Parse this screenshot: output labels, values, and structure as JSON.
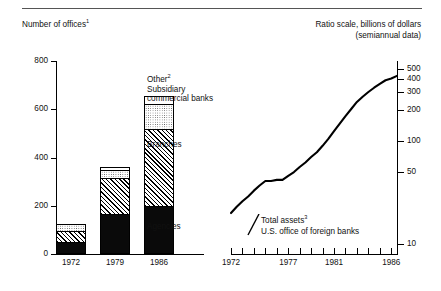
{
  "header": {
    "left_title": "Number of offices",
    "left_title_sup": "1",
    "right_title_line1": "Ratio scale, billions of dollars",
    "right_title_line2": "(semiannual data)"
  },
  "legend": {
    "other": "Other",
    "other_sup": "2",
    "subsidiary_line1": "Subsidiary",
    "subsidiary_line2": "commercial banks",
    "branches": "Branches",
    "agencies": "Agencies"
  },
  "annotation": {
    "line1": "Total assets",
    "line1_sup": "3",
    "line2": "U.S. office of foreign banks"
  },
  "chart_data": [
    {
      "type": "bar",
      "title": "Number of offices",
      "subtype": "stacked-vertical",
      "xlabel": "",
      "ylabel": "",
      "ylim": [
        0,
        800
      ],
      "yticks": [
        0,
        200,
        400,
        600,
        800
      ],
      "ytick_labels": [
        "0",
        "200",
        "400",
        "600",
        "800"
      ],
      "grid": false,
      "legend_position": "right-inline",
      "categories": [
        "1972",
        "1979",
        "1986"
      ],
      "series": [
        {
          "name": "Agencies",
          "pattern": "solid-black",
          "values": [
            50,
            165,
            200
          ]
        },
        {
          "name": "Branches",
          "pattern": "diagonal-hatch",
          "values": [
            45,
            150,
            320
          ]
        },
        {
          "name": "Subsidiary commercial banks",
          "pattern": "dotted-stipple",
          "values": [
            30,
            35,
            100
          ]
        },
        {
          "name": "Other",
          "pattern": "white",
          "values": [
            0,
            10,
            35
          ]
        }
      ],
      "totals": [
        125,
        360,
        655
      ]
    },
    {
      "type": "line",
      "title": "Ratio scale, billions of dollars (semiannual data)",
      "annotation": "Total assets U.S. office of foreign banks",
      "xlabel": "",
      "ylabel": "",
      "scale": "log",
      "ylim": [
        8,
        600
      ],
      "yticks": [
        10,
        50,
        100,
        200,
        300,
        400,
        500
      ],
      "ytick_labels": [
        "10",
        "50",
        "100",
        "200",
        "300",
        "400",
        "500"
      ],
      "xlim": [
        1972,
        1986.5
      ],
      "xticks": [
        1972,
        1973,
        1974,
        1975,
        1976,
        1977,
        1978,
        1979,
        1980,
        1981,
        1982,
        1983,
        1984,
        1985,
        1986
      ],
      "xtick_labels": [
        "1972",
        "",
        "",
        "",
        "",
        "1977",
        "",
        "",
        "",
        "1981",
        "",
        "",
        "",
        "",
        "1986"
      ],
      "grid": false,
      "x": [
        1972,
        1972.5,
        1973,
        1973.5,
        1974,
        1974.5,
        1975,
        1975.5,
        1976,
        1976.5,
        1977,
        1977.5,
        1978,
        1978.5,
        1979,
        1979.5,
        1980,
        1980.5,
        1981,
        1981.5,
        1982,
        1982.5,
        1983,
        1983.5,
        1984,
        1984.5,
        1985,
        1985.5,
        1986,
        1986.5
      ],
      "values": [
        20,
        23,
        26,
        29,
        33,
        37,
        41,
        41,
        42,
        42,
        46,
        50,
        56,
        62,
        70,
        78,
        90,
        105,
        125,
        148,
        175,
        205,
        240,
        270,
        300,
        330,
        360,
        390,
        405,
        430
      ]
    }
  ]
}
